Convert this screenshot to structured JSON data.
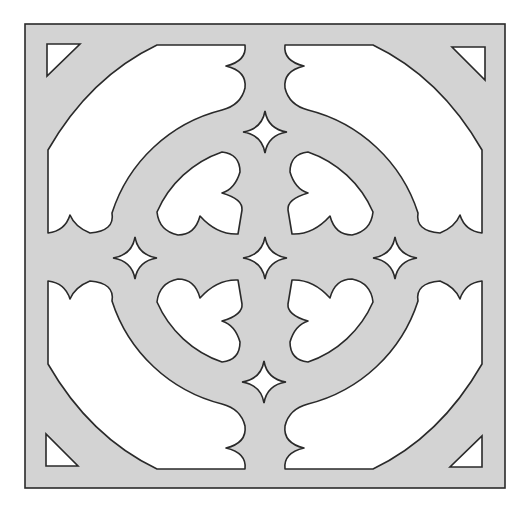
{
  "figure": {
    "colors": {
      "background": "#ffffff",
      "panel_fill": "#d3d3d3",
      "cutout_fill": "#ffffff",
      "outline": "#2a2a2a"
    },
    "panel": {
      "x": 25,
      "y": 24,
      "width": 480,
      "height": 464
    },
    "center": {
      "x": 265,
      "y": 257
    },
    "corner_triangles": [
      {
        "name": "top-left",
        "points": [
          [
            47,
            44
          ],
          [
            80,
            44
          ],
          [
            47,
            76
          ]
        ]
      },
      {
        "name": "top-right",
        "points": [
          [
            452,
            47
          ],
          [
            485,
            47
          ],
          [
            485,
            80
          ]
        ]
      },
      {
        "name": "bottom-left",
        "points": [
          [
            46,
            434
          ],
          [
            46,
            466
          ],
          [
            78,
            466
          ]
        ]
      },
      {
        "name": "bottom-right",
        "points": [
          [
            482,
            436
          ],
          [
            482,
            467
          ],
          [
            450,
            467
          ]
        ]
      }
    ],
    "stars": [
      {
        "name": "top",
        "cx": 265,
        "cy": 132
      },
      {
        "name": "left",
        "cx": 135,
        "cy": 258
      },
      {
        "name": "center",
        "cx": 265,
        "cy": 258
      },
      {
        "name": "right",
        "cx": 395,
        "cy": 258
      },
      {
        "name": "bottom",
        "cx": 264,
        "cy": 382
      }
    ],
    "star_radius": 21
  }
}
